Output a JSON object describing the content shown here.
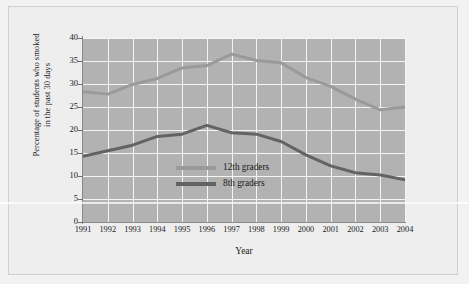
{
  "chart_data": {
    "type": "line",
    "title": "",
    "xlabel": "Year",
    "ylabel": "Percentage of students who smoked in the past 30 days",
    "ylabel_line1": "Percentage of students who smoked",
    "ylabel_line2": "in the past 30 days",
    "categories": [
      "1991",
      "1992",
      "1993",
      "1994",
      "1995",
      "1996",
      "1997",
      "1998",
      "1999",
      "2000",
      "2001",
      "2002",
      "2003",
      "2004"
    ],
    "x": [
      1991,
      1992,
      1993,
      1994,
      1995,
      1996,
      1997,
      1998,
      1999,
      2000,
      2001,
      2002,
      2003,
      2004
    ],
    "xlim": [
      1991,
      2004
    ],
    "ylim": [
      0,
      40
    ],
    "yticks": [
      0,
      5,
      10,
      15,
      20,
      25,
      30,
      35,
      40
    ],
    "grid": true,
    "legend_position": "center",
    "plot_background": "#b2b2b2",
    "gridline_color": "#f4f4f4",
    "series": [
      {
        "name": "12th graders",
        "color": "#9a9a9a",
        "values": [
          28.3,
          27.8,
          29.9,
          31.2,
          33.5,
          34.0,
          36.5,
          35.1,
          34.6,
          31.4,
          29.5,
          26.7,
          24.4,
          25.0
        ]
      },
      {
        "name": "8th graders",
        "color": "#636363",
        "values": [
          14.3,
          15.5,
          16.7,
          18.6,
          19.1,
          21.0,
          19.4,
          19.1,
          17.5,
          14.6,
          12.2,
          10.7,
          10.2,
          9.2
        ]
      }
    ]
  },
  "legend": {
    "items": [
      {
        "label": "12th graders",
        "color": "#9a9a9a"
      },
      {
        "label": "8th graders",
        "color": "#636363"
      }
    ]
  }
}
